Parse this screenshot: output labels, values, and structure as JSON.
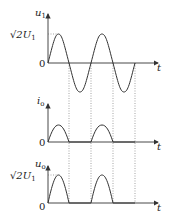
{
  "graphs": [
    {
      "id": "u1",
      "y_label": "u",
      "y_label_sub": "1",
      "x_label": "t",
      "origin_label": "0",
      "peak_label": "√2U",
      "peak_label_sub": "1",
      "waveform": "full sine"
    },
    {
      "id": "io",
      "y_label": "i",
      "y_label_sub": "o",
      "x_label": "t",
      "origin_label": "0",
      "waveform": "half-wave rectified (positive halves only)"
    },
    {
      "id": "uo",
      "y_label": "u",
      "y_label_sub": "o",
      "x_label": "t",
      "origin_label": "0",
      "peak_label": "√2U",
      "peak_label_sub": "1",
      "waveform": "half-wave rectified (positive halves only)"
    }
  ],
  "colors": {
    "line": "#333333",
    "guide": "#666666"
  }
}
